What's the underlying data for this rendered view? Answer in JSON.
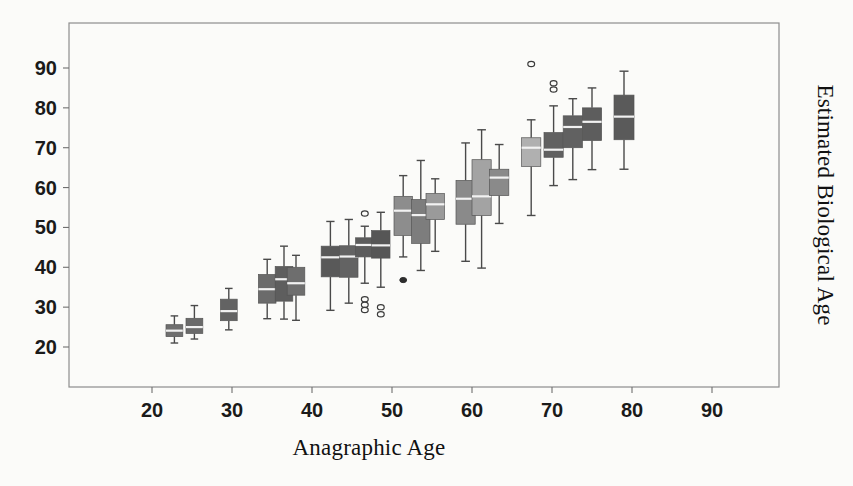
{
  "chart_data": {
    "type": "box",
    "title": "",
    "xlabel": "Anagraphic Age",
    "ylabel": "Estimated Biological Age",
    "xlim": [
      15,
      95
    ],
    "ylim": [
      14,
      97
    ],
    "xticks": [
      20,
      30,
      40,
      50,
      60,
      70,
      80,
      90
    ],
    "yticks": [
      20,
      30,
      40,
      50,
      60,
      70,
      80,
      90
    ],
    "grid": false,
    "legend": null,
    "frame": "box",
    "boxes": [
      {
        "x": 22.8,
        "q1": 22.6,
        "median": 24.1,
        "q3": 25.6,
        "lower": 21.0,
        "upper": 27.8,
        "width": 2.1,
        "color": "#6f6f6f",
        "outliers": []
      },
      {
        "x": 25.3,
        "q1": 23.4,
        "median": 25.0,
        "q3": 27.2,
        "lower": 22.0,
        "upper": 30.4,
        "width": 2.1,
        "color": "#6a6a6a",
        "outliers": []
      },
      {
        "x": 29.6,
        "q1": 26.6,
        "median": 29.0,
        "q3": 32.0,
        "lower": 24.3,
        "upper": 34.7,
        "width": 2.1,
        "color": "#636363",
        "outliers": []
      },
      {
        "x": 34.4,
        "q1": 31.0,
        "median": 34.5,
        "q3": 38.2,
        "lower": 27.1,
        "upper": 42.0,
        "width": 2.2,
        "color": "#6b6b6b",
        "outliers": []
      },
      {
        "x": 36.5,
        "q1": 31.5,
        "median": 37.0,
        "q3": 40.2,
        "lower": 27.0,
        "upper": 45.3,
        "width": 2.2,
        "color": "#5e5e5e",
        "outliers": []
      },
      {
        "x": 38.0,
        "q1": 33.0,
        "median": 36.0,
        "q3": 40.0,
        "lower": 26.7,
        "upper": 43.0,
        "width": 2.2,
        "color": "#6e6e6e",
        "outliers": []
      },
      {
        "x": 42.3,
        "q1": 37.6,
        "median": 42.5,
        "q3": 45.3,
        "lower": 29.2,
        "upper": 51.5,
        "width": 2.3,
        "color": "#595959",
        "outliers": []
      },
      {
        "x": 44.6,
        "q1": 37.5,
        "median": 42.7,
        "q3": 45.4,
        "lower": 31.0,
        "upper": 52.0,
        "width": 2.3,
        "color": "#636363",
        "outliers": []
      },
      {
        "x": 46.6,
        "q1": 42.6,
        "median": 45.6,
        "q3": 47.4,
        "lower": 36.0,
        "upper": 50.3,
        "width": 2.3,
        "color": "#5c5c5c",
        "outliers": [
          53.5,
          32.0,
          30.6,
          29.3
        ]
      },
      {
        "x": 48.6,
        "q1": 42.3,
        "median": 45.5,
        "q3": 49.2,
        "lower": 35.0,
        "upper": 53.8,
        "width": 2.3,
        "color": "#565656",
        "outliers": [
          30.0,
          28.2
        ]
      },
      {
        "x": 51.4,
        "q1": 48.0,
        "median": 54.2,
        "q3": 57.8,
        "lower": 42.6,
        "upper": 63.0,
        "width": 2.3,
        "color": "#8d8d8d",
        "outliers": [
          36.8
        ]
      },
      {
        "x": 53.6,
        "q1": 46.0,
        "median": 53.1,
        "q3": 57.0,
        "lower": 39.2,
        "upper": 66.8,
        "width": 2.3,
        "color": "#7d7d7d",
        "outliers": []
      },
      {
        "x": 55.4,
        "q1": 52.0,
        "median": 55.8,
        "q3": 58.5,
        "lower": 44.0,
        "upper": 62.2,
        "width": 2.3,
        "color": "#9a9a9a",
        "outliers": []
      },
      {
        "x": 59.2,
        "q1": 50.8,
        "median": 57.2,
        "q3": 61.8,
        "lower": 41.5,
        "upper": 71.2,
        "width": 2.4,
        "color": "#8a8a8a",
        "outliers": []
      },
      {
        "x": 61.2,
        "q1": 53.0,
        "median": 57.8,
        "q3": 67.0,
        "lower": 39.8,
        "upper": 74.5,
        "width": 2.4,
        "color": "#a3a3a3",
        "outliers": []
      },
      {
        "x": 63.4,
        "q1": 58.0,
        "median": 62.5,
        "q3": 64.6,
        "lower": 51.0,
        "upper": 70.8,
        "width": 2.4,
        "color": "#8a8a8a",
        "outliers": []
      },
      {
        "x": 67.4,
        "q1": 65.3,
        "median": 70.0,
        "q3": 72.5,
        "lower": 53.0,
        "upper": 77.0,
        "width": 2.4,
        "color": "#b0b0b0",
        "outliers": [
          91.0
        ]
      },
      {
        "x": 70.2,
        "q1": 67.6,
        "median": 69.5,
        "q3": 73.8,
        "lower": 60.5,
        "upper": 80.5,
        "width": 2.4,
        "color": "#616161",
        "outliers": [
          86.2,
          84.6
        ]
      },
      {
        "x": 72.6,
        "q1": 70.0,
        "median": 75.2,
        "q3": 78.0,
        "lower": 62.0,
        "upper": 82.3,
        "width": 2.4,
        "color": "#616161",
        "outliers": []
      },
      {
        "x": 75.0,
        "q1": 71.8,
        "median": 76.5,
        "q3": 80.0,
        "lower": 64.5,
        "upper": 85.0,
        "width": 2.4,
        "color": "#5d5d5d",
        "outliers": []
      },
      {
        "x": 79.0,
        "q1": 72.0,
        "median": 77.8,
        "q3": 83.2,
        "lower": 64.6,
        "upper": 89.2,
        "width": 2.5,
        "color": "#5a5a5a",
        "outliers": []
      }
    ]
  },
  "axes": {
    "x_tick_labels": [
      "20",
      "30",
      "40",
      "50",
      "60",
      "70",
      "80",
      "90"
    ],
    "y_tick_labels": [
      "20",
      "30",
      "40",
      "50",
      "60",
      "70",
      "80",
      "90"
    ],
    "x_axis_title": "Anagraphic Age",
    "y_axis_title": "Estimated Biological Age"
  },
  "colors": {
    "frame": "#8d8d8d",
    "text": "#1a1a1a",
    "median": "#f2f2f2",
    "background": "#fbfbf9"
  }
}
